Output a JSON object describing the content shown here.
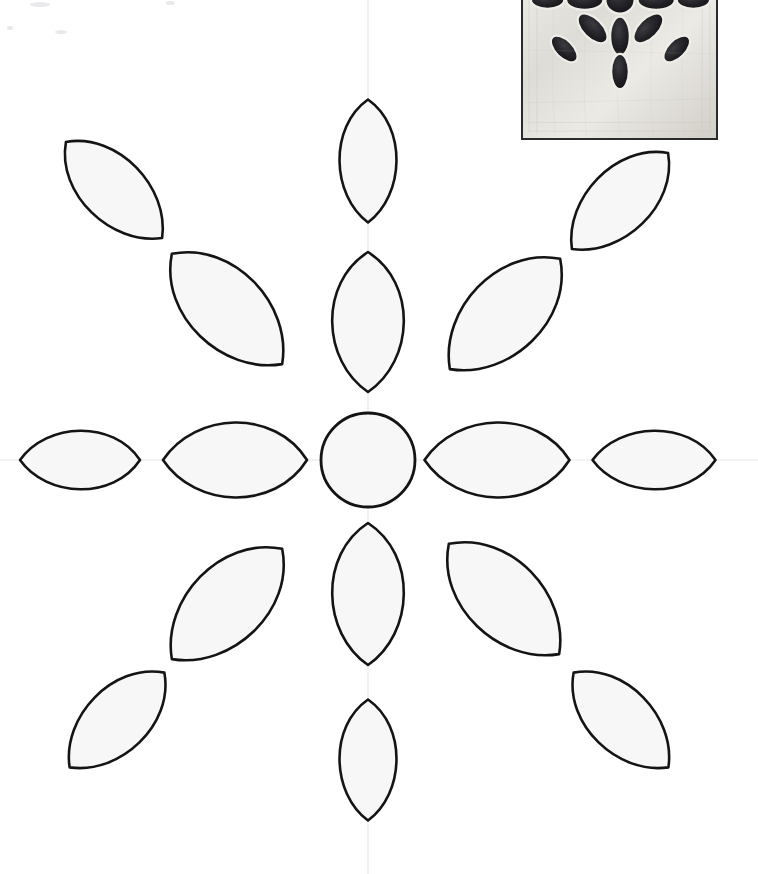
{
  "page": {
    "kind": "printed-pattern-template",
    "width": 758,
    "height": 874,
    "background_color": "#ffffff"
  },
  "colors": {
    "outline": "#141414",
    "petal_fill": "#f7f7f7",
    "guideline": "#efeff0",
    "photo_border": "#2b2b2b",
    "photo_fabric_light": "#e3e1dc",
    "photo_cutout_dark": "#1d1d20"
  },
  "pattern": {
    "name": "twelve-petal radial flower",
    "center": {
      "x": 368,
      "y": 460
    },
    "center_circle": {
      "cx": 368,
      "cy": 460,
      "r": 47,
      "label": "center-circle"
    },
    "guidelines": {
      "vertical_x": 368,
      "horizontal_y": 460,
      "note": "faint registration crosshair"
    },
    "ring_counts": {
      "inner_petals": 8,
      "outer_petals": 8,
      "center_shapes": 1
    },
    "inner_petals": [
      {
        "id": "inner-top",
        "cx": 368,
        "cy": 322,
        "len": 140,
        "wid": 88,
        "angle": 0
      },
      {
        "id": "inner-bottom",
        "cx": 368,
        "cy": 594,
        "len": 142,
        "wid": 88,
        "angle": 0
      },
      {
        "id": "inner-left",
        "cx": 235,
        "cy": 460,
        "len": 144,
        "wid": 92,
        "angle": 90
      },
      {
        "id": "inner-right",
        "cx": 497,
        "cy": 460,
        "len": 145,
        "wid": 92,
        "angle": 90
      },
      {
        "id": "inner-upper-left",
        "cx": 227,
        "cy": 309,
        "len": 156,
        "wid": 94,
        "angle": -45
      },
      {
        "id": "inner-upper-right",
        "cx": 505,
        "cy": 314,
        "len": 156,
        "wid": 94,
        "angle": 45
      },
      {
        "id": "inner-lower-left",
        "cx": 227,
        "cy": 604,
        "len": 156,
        "wid": 94,
        "angle": 45
      },
      {
        "id": "inner-lower-right",
        "cx": 504,
        "cy": 599,
        "len": 156,
        "wid": 94,
        "angle": -45
      }
    ],
    "outer_petals": [
      {
        "id": "outer-top",
        "cx": 368,
        "cy": 161,
        "len": 123,
        "wid": 70,
        "angle": 0
      },
      {
        "id": "outer-bottom",
        "cx": 368,
        "cy": 760,
        "len": 121,
        "wid": 70,
        "angle": 0
      },
      {
        "id": "outer-left",
        "cx": 80,
        "cy": 460,
        "len": 120,
        "wid": 72,
        "angle": 90
      },
      {
        "id": "outer-right",
        "cx": 654,
        "cy": 460,
        "len": 123,
        "wid": 72,
        "angle": 90
      },
      {
        "id": "outer-upper-left",
        "cx": 114,
        "cy": 190,
        "len": 136,
        "wid": 78,
        "angle": -45
      },
      {
        "id": "outer-upper-right",
        "cx": 620,
        "cy": 201,
        "len": 136,
        "wid": 78,
        "angle": 45
      },
      {
        "id": "outer-lower-left",
        "cx": 117,
        "cy": 720,
        "len": 134,
        "wid": 78,
        "angle": 45
      },
      {
        "id": "outer-lower-right",
        "cx": 621,
        "cy": 720,
        "len": 134,
        "wid": 78,
        "angle": -45
      }
    ]
  },
  "photo_inset": {
    "name": "finished-block-photo",
    "description": "black and white photograph of the finished quilted appliqué block",
    "position": {
      "left": 521,
      "top": -46,
      "width": 197,
      "height": 186
    },
    "visible_portion": {
      "left": 521,
      "top": 0,
      "width": 197,
      "height": 140
    },
    "has_border": true
  }
}
